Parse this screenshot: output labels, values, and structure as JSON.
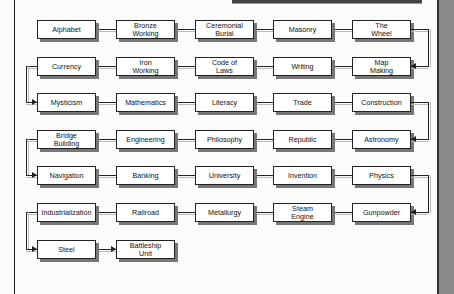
{
  "diagram": {
    "title": "",
    "rows": [
      [
        "Alphabet",
        "Bronze\nWorking",
        "Ceremonial\nBurial",
        "Masonry",
        "The\nWheel"
      ],
      [
        "Currency",
        "Iron\nWorking",
        "Code of\nLaws",
        "Writing",
        "Map\nMaking"
      ],
      [
        "Mysticism",
        "Mathematics",
        "Literacy",
        "Trade",
        "Construction"
      ],
      [
        "Bridge\nBuilding",
        "Engineering",
        "Philosophy",
        "Republic",
        "Astronomy"
      ],
      [
        "Navigation",
        "Banking",
        "University",
        "Invention",
        "Physics"
      ],
      [
        "Industrialization",
        "Railroad",
        "Metallurgy",
        "Steam\nEngine",
        "Gunpowder"
      ],
      [
        "Steel",
        "Battleship\nUnit"
      ]
    ]
  }
}
